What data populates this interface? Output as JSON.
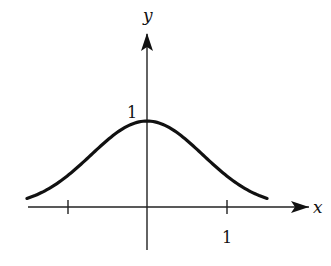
{
  "chart_data": {
    "type": "line",
    "title": "",
    "function": "y = e^(-x^2)",
    "xlabel": "x",
    "ylabel": "y",
    "xlim": [
      -1.52,
      1.52
    ],
    "ylim": [
      0,
      1
    ],
    "grid": false,
    "legend": null,
    "x_ticks": [
      -1,
      1
    ],
    "x_tick_labels": [
      "",
      "1"
    ],
    "y_tick_labels": [
      "1"
    ],
    "series": [
      {
        "name": "bell curve",
        "x": [
          -1.52,
          -1.25,
          -1.0,
          -0.75,
          -0.5,
          -0.25,
          0,
          0.25,
          0.5,
          0.75,
          1.0,
          1.25,
          1.52
        ],
        "values": [
          0.1,
          0.21,
          0.37,
          0.57,
          0.78,
          0.94,
          1.0,
          0.94,
          0.78,
          0.57,
          0.37,
          0.21,
          0.1
        ]
      }
    ],
    "colors": {
      "curve": "#111111",
      "axes": "#222222"
    }
  },
  "labels": {
    "x_axis": "x",
    "y_axis": "y",
    "x_tick_one": "1",
    "y_peak_one": "1"
  }
}
